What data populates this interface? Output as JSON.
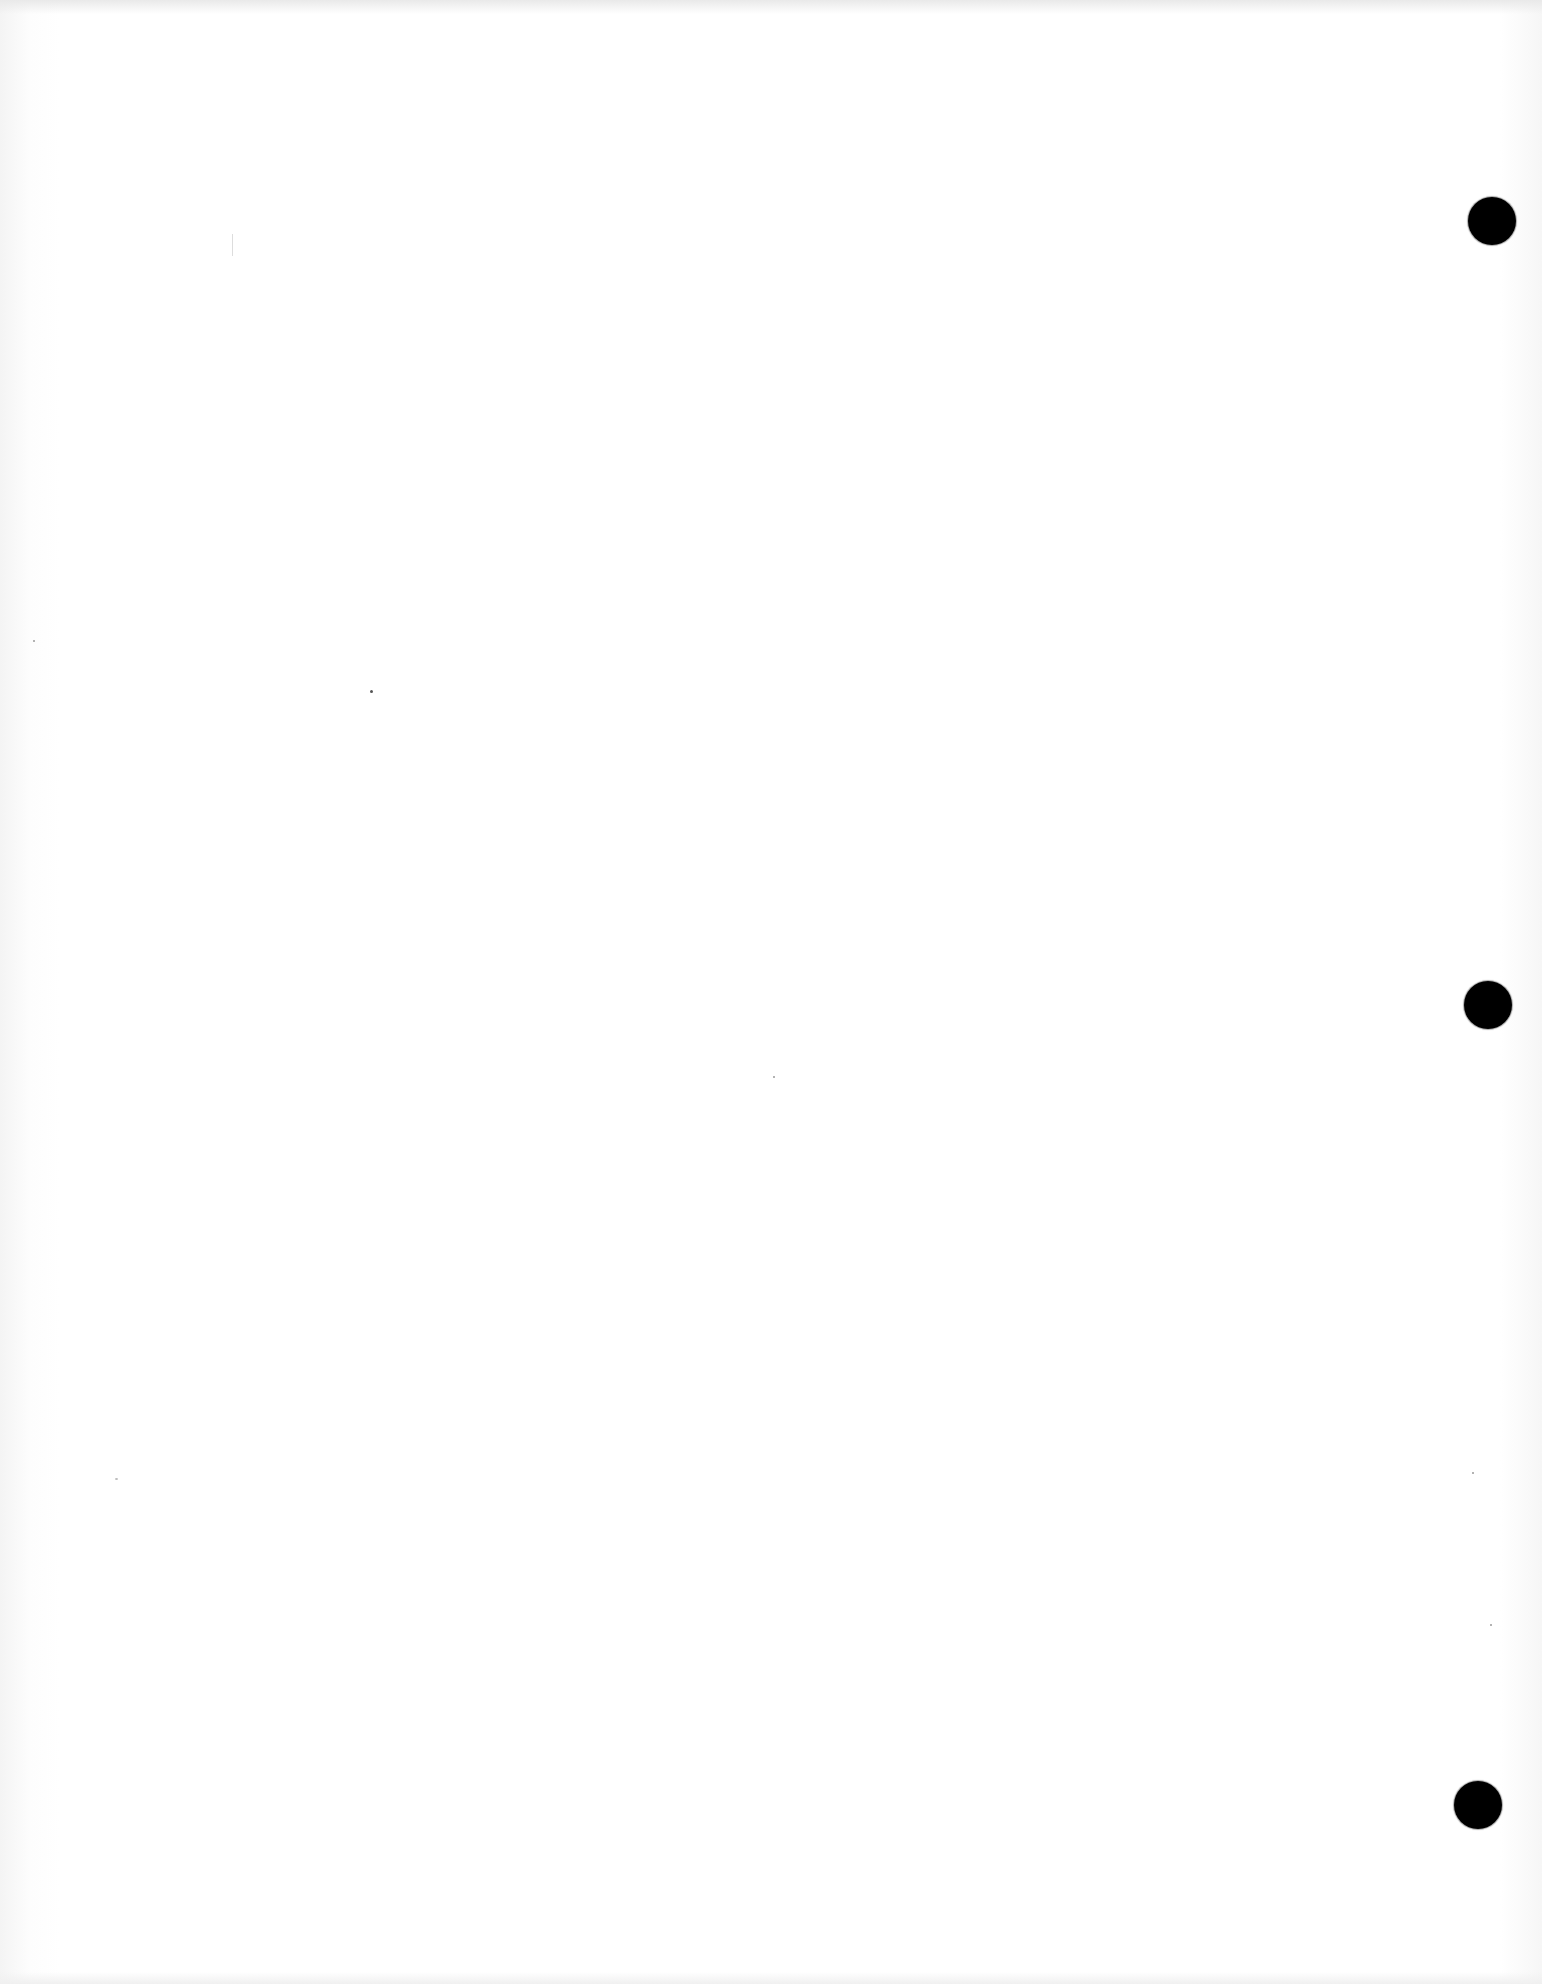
{
  "document": {
    "type": "blank scanned page",
    "background_color": "#ffffff",
    "text": ""
  },
  "punch_holes": [
    {
      "cx": 1492,
      "cy": 221,
      "r": 24,
      "color": "#000000"
    },
    {
      "cx": 1488,
      "cy": 1005,
      "r": 24,
      "color": "#000000"
    },
    {
      "cx": 1478,
      "cy": 1805,
      "r": 24,
      "color": "#000000"
    }
  ]
}
